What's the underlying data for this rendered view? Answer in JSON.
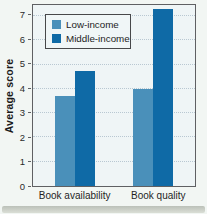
{
  "figure": {
    "y_axis_title": "Average score",
    "x_category_labels": [
      "Book availability",
      "Book quality"
    ],
    "legend": [
      {
        "label": "Low-income",
        "color": "#4a90ba"
      },
      {
        "label": "Middle-income",
        "color": "#0f6aa6"
      }
    ]
  },
  "chart_data": {
    "type": "bar",
    "categories": [
      "Book availability",
      "Book quality"
    ],
    "series": [
      {
        "name": "Low-income",
        "values": [
          3.7,
          4.0
        ],
        "color": "#4a90ba"
      },
      {
        "name": "Middle-income",
        "values": [
          4.75,
          7.3
        ],
        "color": "#0f6aa6"
      }
    ],
    "title": "",
    "xlabel": "",
    "ylabel": "Average score",
    "ylim": [
      0,
      7.45
    ],
    "yticks": [
      0,
      1,
      2,
      3,
      4,
      5,
      6,
      7
    ],
    "grid": "horizontal-dotted",
    "legend_position": "upper left"
  },
  "colors": {
    "page_bg": "#f2f6f3",
    "plot_bg": "#eff5f6",
    "grid": "#b9c8d2",
    "plot_border": "#5f6063",
    "text": "#1f1f1f"
  }
}
